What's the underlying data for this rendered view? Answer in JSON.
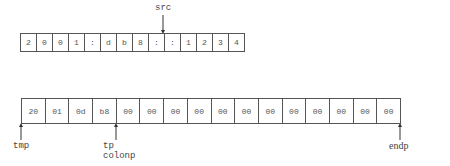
{
  "src_buffer": {
    "pointer_label": "src",
    "cells": [
      "2",
      "0",
      "0",
      "1",
      ":",
      "d",
      "b",
      "8",
      ":",
      ":",
      "1",
      "2",
      "3",
      "4"
    ]
  },
  "tmp_buffer": {
    "cells": [
      "20",
      "01",
      "0d",
      "b8",
      "00",
      "00",
      "00",
      "00",
      "00",
      "00",
      "00",
      "00",
      "00",
      "00",
      "00",
      "00"
    ],
    "pointers": {
      "tmp": "tmp",
      "tp": "tp",
      "colonp": "colonp",
      "endp": "endp"
    }
  }
}
